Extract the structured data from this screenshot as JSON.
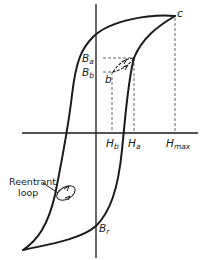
{
  "diagram": {
    "title": "",
    "type": "B-H hysteresis loop with minor loop and reentrant loop",
    "labels": {
      "point_c": "c",
      "Ba": {
        "main": "B",
        "sub": "a"
      },
      "Bb": {
        "main": "B",
        "sub": "b"
      },
      "point_b": "b",
      "Ha": {
        "main": "H",
        "sub": "a"
      },
      "Hb": {
        "main": "H",
        "sub": "b"
      },
      "Hmax": {
        "main": "H",
        "sub": "max"
      },
      "Br": {
        "main": "B",
        "sub": "r"
      }
    },
    "annotations": {
      "reentrant_line1": "Reentrant",
      "reentrant_line2": "loop"
    },
    "colors": {
      "line": "#1a1a1a",
      "dashed": "#555555",
      "background": "#ffffff"
    }
  }
}
